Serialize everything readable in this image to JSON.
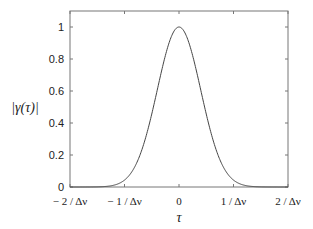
{
  "chart_data": {
    "type": "line",
    "title": "",
    "xlabel": "τ",
    "ylabel": "|γ(τ)|",
    "xlim": [
      -2,
      2
    ],
    "ylim": [
      0,
      1.1
    ],
    "x_unit": "1/Δν",
    "xticks": [
      -2,
      -1,
      0,
      1,
      2
    ],
    "xtick_labels": [
      "− 2 / Δν",
      "− 1 / Δν",
      "0",
      "1 / Δν",
      "2 / Δν"
    ],
    "yticks": [
      0,
      0.2,
      0.4,
      0.6,
      0.8,
      1
    ],
    "ytick_labels": [
      "0",
      "0.2",
      "0.4",
      "0.6",
      "0.8",
      "1"
    ],
    "grid": false,
    "legend": "none",
    "series": [
      {
        "name": "|γ(τ)|",
        "function": "exp(-π (τΔν)²)",
        "x": [
          -2,
          -1.5,
          -1.25,
          -1,
          -0.75,
          -0.5,
          -0.25,
          0,
          0.25,
          0.5,
          0.75,
          1,
          1.25,
          1.5,
          2
        ],
        "y": [
          0.0,
          0.001,
          0.007,
          0.043,
          0.171,
          0.456,
          0.822,
          1.0,
          0.822,
          0.456,
          0.171,
          0.043,
          0.007,
          0.001,
          0.0
        ],
        "color": "#444444"
      }
    ]
  }
}
